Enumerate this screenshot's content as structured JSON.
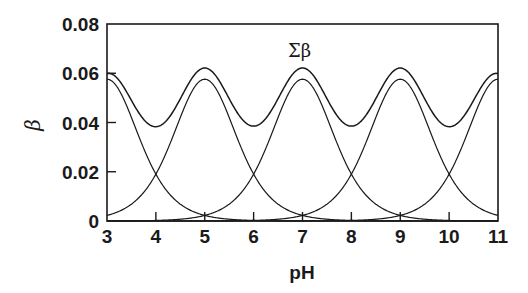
{
  "chart_data": {
    "type": "line",
    "title": "",
    "xlabel": "pH",
    "ylabel": "β",
    "xlim": [
      3,
      11
    ],
    "ylim": [
      0,
      0.08
    ],
    "grid": false,
    "legend": null,
    "x_ticks": [
      "3",
      "4",
      "5",
      "6",
      "7",
      "8",
      "9",
      "10",
      "11"
    ],
    "y_ticks": [
      "0",
      "0.02",
      "0.04",
      "0.06",
      "0.08"
    ],
    "annotations": [
      {
        "text": "Σβ",
        "x": 6.9,
        "y": 0.068
      }
    ],
    "model": {
      "description": "Individual buffer capacity curves β = 2.303·C·x/(1+x)^2, x = 10^(pH−pKa); Σβ is their sum",
      "C": 0.1,
      "pKa": [
        3,
        5,
        7,
        9,
        11
      ]
    },
    "x": [
      3,
      4,
      5,
      6,
      7,
      8,
      9,
      10,
      11
    ],
    "series": [
      {
        "name": "β (pKa 3)",
        "values": [
          0.0576,
          0.019,
          0.0023,
          0.0002,
          0.0,
          0.0,
          0.0,
          0.0,
          0.0
        ]
      },
      {
        "name": "β (pKa 5)",
        "values": [
          0.0023,
          0.019,
          0.0576,
          0.019,
          0.0023,
          0.0002,
          0.0,
          0.0,
          0.0
        ]
      },
      {
        "name": "β (pKa 7)",
        "values": [
          0.0,
          0.0002,
          0.0023,
          0.019,
          0.0576,
          0.019,
          0.0023,
          0.0002,
          0.0
        ]
      },
      {
        "name": "β (pKa 9)",
        "values": [
          0.0,
          0.0,
          0.0,
          0.0002,
          0.0023,
          0.019,
          0.0576,
          0.019,
          0.0023
        ]
      },
      {
        "name": "β (pKa 11)",
        "values": [
          0.0,
          0.0,
          0.0,
          0.0,
          0.0,
          0.0002,
          0.0023,
          0.019,
          0.0576
        ]
      },
      {
        "name": "Σβ",
        "values": [
          0.0599,
          0.0383,
          0.0621,
          0.0385,
          0.0621,
          0.0385,
          0.0621,
          0.0383,
          0.0599
        ]
      }
    ]
  },
  "labels": {
    "xlabel": "pH",
    "ylabel": "β",
    "sum_label": "Σβ"
  }
}
